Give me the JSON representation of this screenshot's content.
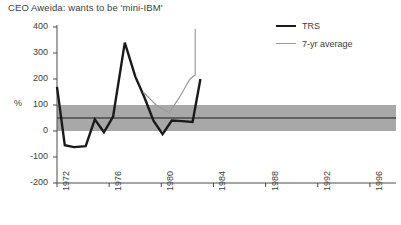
{
  "chart_data": {
    "type": "line",
    "title": "CEO Aweida: wants to be 'mini-IBM'",
    "xlabel": "",
    "ylabel": "%",
    "ylim": [
      -200,
      400
    ],
    "xlim": [
      1972,
      1998
    ],
    "yticks": [
      400,
      300,
      200,
      100,
      0,
      -100,
      -200
    ],
    "ytick_labels": [
      "400",
      "300",
      "200",
      "100",
      "0",
      "-100",
      "-200"
    ],
    "xticks": [
      1972,
      1976,
      1980,
      1984,
      1988,
      1992,
      1996
    ],
    "xtick_labels": [
      "1972",
      "1976",
      "1980",
      "1984",
      "1988",
      "1992",
      "1996"
    ],
    "grid": false,
    "legend_position": "top-right",
    "reference_band": {
      "label": "market range band",
      "y_low": 0,
      "y_high": 100,
      "midline": 50,
      "fill_color": "#a8a8a8",
      "midline_color": "#4a4a4a"
    },
    "series": [
      {
        "name": "TRS",
        "color": "#1a1a1a",
        "width": 2.4,
        "x": [
          1972.0,
          1972.6,
          1973.3,
          1974.2,
          1974.9,
          1975.6,
          1976.3,
          1977.2,
          1978.0,
          1978.7,
          1979.4,
          1980.1,
          1980.8,
          1981.6,
          1982.4,
          1983.0
        ],
        "y": [
          170,
          -55,
          -62,
          -58,
          45,
          -5,
          55,
          340,
          210,
          130,
          40,
          -12,
          40,
          38,
          35,
          200
        ]
      },
      {
        "name": "7-yr average",
        "color": "#9a9a9a",
        "width": 1.2,
        "x": [
          1978.6,
          1979.6,
          1980.6,
          1981.4,
          1982.2,
          1982.6,
          1982.6
        ],
        "y": [
          150,
          100,
          70,
          130,
          200,
          215,
          392
        ]
      }
    ],
    "legend": [
      {
        "label": "TRS",
        "color": "#1a1a1a",
        "style": "thick-line"
      },
      {
        "label": "7-yr average",
        "color": "#9a9a9a",
        "style": "thin-line"
      }
    ]
  }
}
